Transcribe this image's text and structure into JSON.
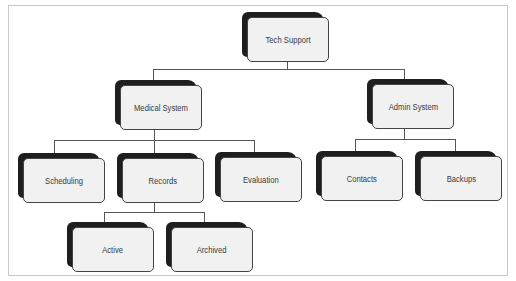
{
  "diagram": {
    "type": "org-chart",
    "caption": "FIGURE 2",
    "root": {
      "label": "Tech Support",
      "children": [
        {
          "label": "Medical System",
          "children": [
            {
              "label": "Scheduling"
            },
            {
              "label": "Records",
              "children": [
                {
                  "label": "Active"
                },
                {
                  "label": "Archived"
                }
              ]
            },
            {
              "label": "Evaluation"
            }
          ]
        },
        {
          "label": "Admin System",
          "children": [
            {
              "label": "Contacts"
            },
            {
              "label": "Backups"
            }
          ]
        }
      ]
    },
    "nodes": {
      "tech_support": "Tech Support",
      "medical_system": "Medical System",
      "admin_system": "Admin System",
      "scheduling": "Scheduling",
      "records": "Records",
      "evaluation": "Evaluation",
      "contacts": "Contacts",
      "backups": "Backups",
      "active": "Active",
      "archived": "Archived"
    },
    "colors": {
      "box_fill": "#f1f1f1",
      "box_shadow": "#1e1e1e",
      "box_border": "#444444",
      "connector": "#555555",
      "frame_border": "#c8c8c8"
    }
  }
}
